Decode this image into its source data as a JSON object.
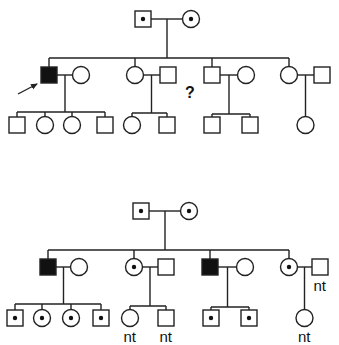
{
  "figure": {
    "type": "pedigree",
    "stroke_color": "#222222",
    "fill_affected": "#111111",
    "carrier_dot_color": "#111111"
  },
  "pedigrees": [
    {
      "name": "top",
      "parents": [
        {
          "sex": "male",
          "status": "carrier",
          "x": 143,
          "y": 19
        },
        {
          "sex": "female",
          "status": "carrier",
          "x": 191,
          "y": 19
        }
      ],
      "sibship_y": 58,
      "children": [
        {
          "person": {
            "sex": "male",
            "status": "affected",
            "x": 49,
            "y": 75,
            "proband": true
          },
          "spouse": {
            "sex": "female",
            "status": "unaffected",
            "x": 81,
            "y": 75
          },
          "kids_y": 125,
          "kids_line_y": 112,
          "kids": [
            {
              "sex": "male",
              "status": "unaffected",
              "x": 17,
              "label": ""
            },
            {
              "sex": "female",
              "status": "unaffected",
              "x": 45,
              "label": ""
            },
            {
              "sex": "female",
              "status": "unaffected",
              "x": 72,
              "label": ""
            },
            {
              "sex": "male",
              "status": "unaffected",
              "x": 105,
              "label": ""
            }
          ]
        },
        {
          "person": {
            "sex": "female",
            "status": "unaffected",
            "x": 135,
            "y": 75
          },
          "spouse": {
            "sex": "male",
            "status": "unaffected",
            "x": 168,
            "y": 75
          },
          "kids_y": 125,
          "kids_line_y": 113,
          "kids": [
            {
              "sex": "female",
              "status": "unaffected",
              "x": 132,
              "label": ""
            },
            {
              "sex": "male",
              "status": "unaffected",
              "x": 167,
              "label": ""
            }
          ]
        },
        {
          "person": {
            "sex": "male",
            "status": "unknown",
            "x": 212,
            "y": 75,
            "question": "?"
          },
          "spouse": {
            "sex": "female",
            "status": "unaffected",
            "x": 246,
            "y": 75
          },
          "kids_y": 125,
          "kids_line_y": 114,
          "kids": [
            {
              "sex": "male",
              "status": "unaffected",
              "x": 212,
              "label": ""
            },
            {
              "sex": "male",
              "status": "unaffected",
              "x": 250,
              "label": ""
            }
          ]
        },
        {
          "person": {
            "sex": "female",
            "status": "unaffected",
            "x": 289,
            "y": 75
          },
          "spouse": {
            "sex": "male",
            "status": "unaffected",
            "x": 322,
            "y": 75
          },
          "kids_y": 125,
          "kids_line_y": null,
          "kids": [
            {
              "sex": "female",
              "status": "unaffected",
              "x": 305,
              "label": ""
            }
          ]
        }
      ]
    },
    {
      "name": "bottom",
      "parents": [
        {
          "sex": "male",
          "status": "carrier",
          "x": 141,
          "y": 211
        },
        {
          "sex": "female",
          "status": "carrier",
          "x": 189,
          "y": 211
        }
      ],
      "sibship_y": 250,
      "children": [
        {
          "person": {
            "sex": "male",
            "status": "affected",
            "x": 48,
            "y": 267
          },
          "spouse": {
            "sex": "female",
            "status": "unaffected",
            "x": 79,
            "y": 267
          },
          "kids_y": 318,
          "kids_line_y": 304,
          "kids": [
            {
              "sex": "male",
              "status": "carrier",
              "x": 15,
              "label": ""
            },
            {
              "sex": "female",
              "status": "carrier",
              "x": 42,
              "label": ""
            },
            {
              "sex": "female",
              "status": "carrier",
              "x": 71,
              "label": ""
            },
            {
              "sex": "male",
              "status": "carrier",
              "x": 101,
              "label": ""
            }
          ]
        },
        {
          "person": {
            "sex": "female",
            "status": "carrier",
            "x": 134,
            "y": 267
          },
          "spouse": {
            "sex": "male",
            "status": "unaffected",
            "x": 166,
            "y": 267
          },
          "kids_y": 318,
          "kids_line_y": 306,
          "kids": [
            {
              "sex": "female",
              "status": "unaffected",
              "x": 130,
              "label": "nt"
            },
            {
              "sex": "male",
              "status": "unaffected",
              "x": 166,
              "label": "nt"
            }
          ]
        },
        {
          "person": {
            "sex": "male",
            "status": "affected",
            "x": 210,
            "y": 267
          },
          "spouse": {
            "sex": "female",
            "status": "unaffected",
            "x": 245,
            "y": 267
          },
          "kids_y": 318,
          "kids_line_y": 307,
          "kids": [
            {
              "sex": "male",
              "status": "carrier",
              "x": 211,
              "label": ""
            },
            {
              "sex": "male",
              "status": "carrier",
              "x": 249,
              "label": ""
            }
          ]
        },
        {
          "person": {
            "sex": "female",
            "status": "carrier",
            "x": 289,
            "y": 267
          },
          "spouse": {
            "sex": "male",
            "status": "unaffected",
            "x": 320,
            "y": 267,
            "label": "nt"
          },
          "kids_y": 318,
          "kids_line_y": null,
          "kids": [
            {
              "sex": "female",
              "status": "unaffected",
              "x": 305,
              "label": "nt"
            }
          ]
        }
      ]
    }
  ],
  "proband_arrow": {
    "from": [
      18,
      94
    ],
    "to": [
      37,
      84
    ]
  }
}
